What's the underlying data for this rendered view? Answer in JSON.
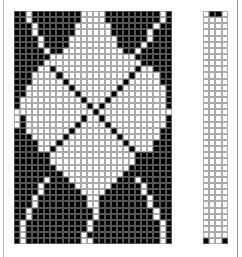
{
  "colors": {
    "filled": "#000000",
    "empty": "#ffffff",
    "grid": "#aaaaaa"
  },
  "main_grid": {
    "cols": 26,
    "rows": [
      "11011111111000011111111101",
      "11011111111000011111111101",
      "11101111110000001111111011",
      "11101111110000001111110111",
      "11110111100000000111110111",
      "11110111100000000111101111",
      "11111011000000000011011111",
      "11111100000000000000111111",
      "11111000000000000000011111",
      "11110010000000000000100111",
      "11100001000000000001000011",
      "11100000100000000010000011",
      "11000000010000000100000001",
      "11000000001000001000000001",
      "10000000000100010000000001",
      "10000000000010100000000001",
      "00000000000001000000000000",
      "01000000000100100000000001",
      "01000000001000010000000001",
      "11000000010000001000000011",
      "11100000100000000100000011",
      "11110001000000000010000111",
      "11110010000000000001000111",
      "11111100000000000000111111",
      "11111100000000000000111111",
      "11111110000000000001111111",
      "11111111000000000011111111",
      "11111011100000000111011111",
      "11110111110000001111101111",
      "11110111111000011111101111",
      "11101111111100111111110111",
      "11101111111100111111110111",
      "11011111111110111111111011",
      "11011111111110111111111011",
      "10111111111101111111111101",
      "10111111111101111111111101",
      "10111111111011111111111101",
      "10111111111001111111111101"
    ]
  },
  "side_strip": {
    "cols": 4,
    "rows": [
      "0110",
      "0000",
      "0000",
      "0000",
      "0000",
      "0000",
      "0000",
      "0000",
      "0000",
      "0000",
      "0000",
      "0000",
      "0000",
      "0000",
      "0000",
      "0000",
      "0000",
      "0000",
      "0000",
      "0000",
      "0000",
      "0000",
      "0000",
      "0000",
      "0000",
      "0000",
      "0000",
      "0000",
      "0000",
      "0000",
      "0000",
      "0000",
      "0000",
      "0000",
      "0000",
      "0000",
      "0000",
      "1001"
    ]
  }
}
